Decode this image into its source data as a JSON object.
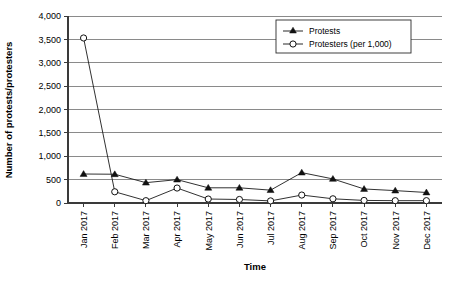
{
  "chart_data": {
    "type": "line",
    "title": "",
    "xlabel": "Time",
    "ylabel": "Number of protests/protesters",
    "categories": [
      "Jan 2017",
      "Feb 2017",
      "Mar 2017",
      "Apr 2017",
      "May 2017",
      "Jun 2017",
      "Jul 2017",
      "Aug 2017",
      "Sep 2017",
      "Oct 2017",
      "Nov 2017",
      "Dec 2017"
    ],
    "series": [
      {
        "name": "Protests",
        "marker": "filled-triangle",
        "values": [
          620,
          615,
          435,
          500,
          325,
          325,
          275,
          650,
          515,
          300,
          265,
          225
        ]
      },
      {
        "name": "Protesters (per 1,000)",
        "marker": "open-circle",
        "values": [
          3530,
          240,
          50,
          320,
          85,
          75,
          45,
          170,
          90,
          55,
          50,
          50
        ]
      }
    ],
    "ylim": [
      0,
      4000
    ],
    "ytick_values": [
      0,
      500,
      1000,
      1500,
      2000,
      2500,
      3000,
      3500,
      4000
    ],
    "ytick_labels": [
      "0",
      "500",
      "1,000",
      "1,500",
      "2,000",
      "2,500",
      "3,000",
      "3,500",
      "4,000"
    ],
    "grid": true,
    "legend_position": "top-right",
    "legend_entries": [
      "Protests",
      "Protesters (per 1,000)"
    ],
    "xtick_rotation": 90
  },
  "colors": {
    "background": "#ffffff",
    "grid": "#8a8a8a",
    "axis": "#3a3a3a",
    "series": "#111111"
  }
}
